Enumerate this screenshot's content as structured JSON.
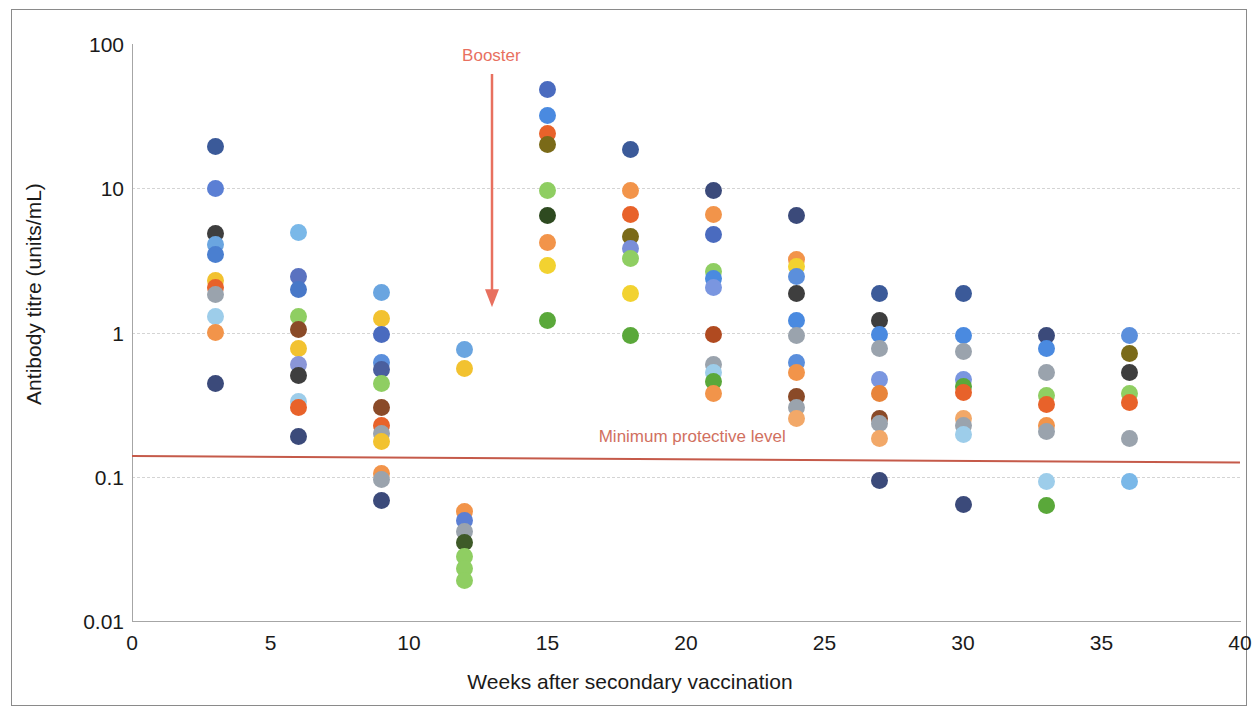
{
  "chart_data": {
    "type": "scatter",
    "title": "",
    "xlabel": "Weeks after secondary vaccination",
    "ylabel": "Antibody titre (units/mL)",
    "yscale": "log",
    "ylim": [
      0.01,
      100
    ],
    "xlim": [
      0,
      40
    ],
    "grid": true,
    "legend": "none",
    "ytick_labels": [
      "100",
      "10",
      "1",
      "0.1",
      "0.01"
    ],
    "ytick_values": [
      100,
      10,
      1,
      0.1,
      0.01
    ],
    "xtick_labels": [
      "0",
      "5",
      "10",
      "15",
      "20",
      "25",
      "30",
      "35",
      "40"
    ],
    "xtick_values": [
      0,
      5,
      10,
      15,
      20,
      25,
      30,
      35,
      40
    ],
    "annotations": [
      {
        "name": "booster",
        "text": "Booster",
        "x": 13.0,
        "color": "#e8705f",
        "arrow_from_y": 62,
        "arrow_to_y": 1.5
      },
      {
        "name": "minimum-protective-level",
        "text": "Minimum protective level",
        "x": 21.0,
        "y": 0.155,
        "color": "#d1705f"
      }
    ],
    "threshold": {
      "label": "Minimum protective level",
      "y_left": 0.142,
      "y_right": 0.128,
      "color": "#c55a4a"
    },
    "points": [
      {
        "x": 3,
        "y": 19.5,
        "color": "#3b5a99"
      },
      {
        "x": 3,
        "y": 9.9,
        "color": "#5b7fd4"
      },
      {
        "x": 3,
        "y": 4.85,
        "color": "#3e3e3e"
      },
      {
        "x": 3,
        "y": 4.05,
        "color": "#6aa5e0"
      },
      {
        "x": 3,
        "y": 3.45,
        "color": "#4a7fd0"
      },
      {
        "x": 3,
        "y": 2.3,
        "color": "#f2c230"
      },
      {
        "x": 3,
        "y": 2.05,
        "color": "#e8622a"
      },
      {
        "x": 3,
        "y": 1.82,
        "color": "#9aa3ad"
      },
      {
        "x": 3,
        "y": 1.3,
        "color": "#9dcdea"
      },
      {
        "x": 3,
        "y": 1.0,
        "color": "#f2944a"
      },
      {
        "x": 3,
        "y": 0.44,
        "color": "#3b4a7a"
      },
      {
        "x": 6,
        "y": 4.95,
        "color": "#7ab8e8"
      },
      {
        "x": 6,
        "y": 2.45,
        "color": "#5a72c0"
      },
      {
        "x": 6,
        "y": 2.0,
        "color": "#4878c8"
      },
      {
        "x": 6,
        "y": 1.3,
        "color": "#8fce62"
      },
      {
        "x": 6,
        "y": 1.05,
        "color": "#8a4a28"
      },
      {
        "x": 6,
        "y": 0.78,
        "color": "#f2c230"
      },
      {
        "x": 6,
        "y": 0.6,
        "color": "#8a96d8"
      },
      {
        "x": 6,
        "y": 0.5,
        "color": "#3e3e3e"
      },
      {
        "x": 6,
        "y": 0.33,
        "color": "#9dcdea"
      },
      {
        "x": 6,
        "y": 0.3,
        "color": "#e8622a"
      },
      {
        "x": 6,
        "y": 0.19,
        "color": "#3b4a7a"
      },
      {
        "x": 9,
        "y": 1.9,
        "color": "#6aa5e0"
      },
      {
        "x": 9,
        "y": 1.25,
        "color": "#f2c230"
      },
      {
        "x": 9,
        "y": 0.97,
        "color": "#4a6bbf"
      },
      {
        "x": 9,
        "y": 0.62,
        "color": "#5b8fdc"
      },
      {
        "x": 9,
        "y": 0.55,
        "color": "#4a5f9e"
      },
      {
        "x": 9,
        "y": 0.44,
        "color": "#8fce62"
      },
      {
        "x": 9,
        "y": 0.3,
        "color": "#8a4a28"
      },
      {
        "x": 9,
        "y": 0.225,
        "color": "#e8622a"
      },
      {
        "x": 9,
        "y": 0.2,
        "color": "#9aa3ad"
      },
      {
        "x": 9,
        "y": 0.175,
        "color": "#f2c230"
      },
      {
        "x": 9,
        "y": 0.105,
        "color": "#f2944a"
      },
      {
        "x": 9,
        "y": 0.095,
        "color": "#9aa3ad"
      },
      {
        "x": 9,
        "y": 0.068,
        "color": "#3b4a7a"
      },
      {
        "x": 12,
        "y": 0.76,
        "color": "#6aa5e0"
      },
      {
        "x": 12,
        "y": 0.56,
        "color": "#f2c230"
      },
      {
        "x": 12,
        "y": 0.057,
        "color": "#f2944a"
      },
      {
        "x": 12,
        "y": 0.05,
        "color": "#5b7fd4"
      },
      {
        "x": 12,
        "y": 0.042,
        "color": "#9aa3ad"
      },
      {
        "x": 12,
        "y": 0.035,
        "color": "#3e5a28"
      },
      {
        "x": 12,
        "y": 0.028,
        "color": "#8fce62"
      },
      {
        "x": 12,
        "y": 0.023,
        "color": "#8fce62"
      },
      {
        "x": 12,
        "y": 0.019,
        "color": "#8fce62"
      },
      {
        "x": 15,
        "y": 48.0,
        "color": "#4a6bbf"
      },
      {
        "x": 15,
        "y": 32.0,
        "color": "#4a8ae0"
      },
      {
        "x": 15,
        "y": 24.0,
        "color": "#e8622a"
      },
      {
        "x": 15,
        "y": 20.0,
        "color": "#7a6a18"
      },
      {
        "x": 15,
        "y": 9.7,
        "color": "#8fce62"
      },
      {
        "x": 15,
        "y": 6.5,
        "color": "#2e4a20"
      },
      {
        "x": 15,
        "y": 4.2,
        "color": "#f2944a"
      },
      {
        "x": 15,
        "y": 2.9,
        "color": "#f2d230"
      },
      {
        "x": 15,
        "y": 1.22,
        "color": "#5aa83a"
      },
      {
        "x": 18,
        "y": 18.5,
        "color": "#3b5a99"
      },
      {
        "x": 18,
        "y": 9.7,
        "color": "#f2944a"
      },
      {
        "x": 18,
        "y": 6.6,
        "color": "#e8622a"
      },
      {
        "x": 18,
        "y": 4.6,
        "color": "#7a6a18"
      },
      {
        "x": 18,
        "y": 3.8,
        "color": "#7a8ed8"
      },
      {
        "x": 18,
        "y": 3.25,
        "color": "#8fce62"
      },
      {
        "x": 18,
        "y": 1.87,
        "color": "#f2d230"
      },
      {
        "x": 18,
        "y": 0.96,
        "color": "#5aa83a"
      },
      {
        "x": 21,
        "y": 9.6,
        "color": "#3b4a7a"
      },
      {
        "x": 21,
        "y": 6.6,
        "color": "#f2944a"
      },
      {
        "x": 21,
        "y": 4.8,
        "color": "#4a6bbf"
      },
      {
        "x": 21,
        "y": 2.65,
        "color": "#8fce62"
      },
      {
        "x": 21,
        "y": 2.35,
        "color": "#4a8ae0"
      },
      {
        "x": 21,
        "y": 2.05,
        "color": "#7a96e0"
      },
      {
        "x": 21,
        "y": 0.97,
        "color": "#b04a20"
      },
      {
        "x": 21,
        "y": 0.6,
        "color": "#9aa3ad"
      },
      {
        "x": 21,
        "y": 0.53,
        "color": "#9dcdea"
      },
      {
        "x": 21,
        "y": 0.46,
        "color": "#5aa83a"
      },
      {
        "x": 21,
        "y": 0.38,
        "color": "#f2944a"
      },
      {
        "x": 24,
        "y": 6.5,
        "color": "#3b4a7a"
      },
      {
        "x": 24,
        "y": 3.2,
        "color": "#f2944a"
      },
      {
        "x": 24,
        "y": 2.85,
        "color": "#f2d230"
      },
      {
        "x": 24,
        "y": 2.45,
        "color": "#5b8fdc"
      },
      {
        "x": 24,
        "y": 1.87,
        "color": "#3e3e3e"
      },
      {
        "x": 24,
        "y": 1.22,
        "color": "#4a8ae0"
      },
      {
        "x": 24,
        "y": 0.95,
        "color": "#9aa3ad"
      },
      {
        "x": 24,
        "y": 0.62,
        "color": "#5b8fdc"
      },
      {
        "x": 24,
        "y": 0.53,
        "color": "#f2944a"
      },
      {
        "x": 24,
        "y": 0.36,
        "color": "#8a4a28"
      },
      {
        "x": 24,
        "y": 0.3,
        "color": "#9aa3ad"
      },
      {
        "x": 24,
        "y": 0.255,
        "color": "#f2a868"
      },
      {
        "x": 27,
        "y": 1.85,
        "color": "#3b5a99"
      },
      {
        "x": 27,
        "y": 1.22,
        "color": "#3e3e3e"
      },
      {
        "x": 27,
        "y": 0.97,
        "color": "#4a8ae0"
      },
      {
        "x": 27,
        "y": 0.78,
        "color": "#9aa3ad"
      },
      {
        "x": 27,
        "y": 0.47,
        "color": "#7a96e0"
      },
      {
        "x": 27,
        "y": 0.38,
        "color": "#e8843a"
      },
      {
        "x": 27,
        "y": 0.255,
        "color": "#8a4a28"
      },
      {
        "x": 27,
        "y": 0.235,
        "color": "#9aa3ad"
      },
      {
        "x": 27,
        "y": 0.185,
        "color": "#f2a868"
      },
      {
        "x": 27,
        "y": 0.094,
        "color": "#3b4a7a"
      },
      {
        "x": 30,
        "y": 1.85,
        "color": "#3b5a99"
      },
      {
        "x": 30,
        "y": 0.96,
        "color": "#4a8ae0"
      },
      {
        "x": 30,
        "y": 0.74,
        "color": "#9aa3ad"
      },
      {
        "x": 30,
        "y": 0.47,
        "color": "#7a96e0"
      },
      {
        "x": 30,
        "y": 0.42,
        "color": "#5aa83a"
      },
      {
        "x": 30,
        "y": 0.385,
        "color": "#e8622a"
      },
      {
        "x": 30,
        "y": 0.255,
        "color": "#f2a868"
      },
      {
        "x": 30,
        "y": 0.225,
        "color": "#9aa3ad"
      },
      {
        "x": 30,
        "y": 0.195,
        "color": "#9dcdea"
      },
      {
        "x": 30,
        "y": 0.064,
        "color": "#3b4a7a"
      },
      {
        "x": 33,
        "y": 0.95,
        "color": "#3b4a7a"
      },
      {
        "x": 33,
        "y": 0.78,
        "color": "#4a8ae0"
      },
      {
        "x": 33,
        "y": 0.53,
        "color": "#9aa3ad"
      },
      {
        "x": 33,
        "y": 0.365,
        "color": "#8fce62"
      },
      {
        "x": 33,
        "y": 0.315,
        "color": "#e8622a"
      },
      {
        "x": 33,
        "y": 0.225,
        "color": "#f2944a"
      },
      {
        "x": 33,
        "y": 0.205,
        "color": "#9aa3ad"
      },
      {
        "x": 33,
        "y": 0.093,
        "color": "#9dcdea"
      },
      {
        "x": 33,
        "y": 0.063,
        "color": "#5aa83a"
      },
      {
        "x": 36,
        "y": 0.95,
        "color": "#5b8fdc"
      },
      {
        "x": 36,
        "y": 0.72,
        "color": "#7a6a18"
      },
      {
        "x": 36,
        "y": 0.53,
        "color": "#3e3e3e"
      },
      {
        "x": 36,
        "y": 0.38,
        "color": "#8fce62"
      },
      {
        "x": 36,
        "y": 0.325,
        "color": "#e8622a"
      },
      {
        "x": 36,
        "y": 0.185,
        "color": "#9aa3ad"
      },
      {
        "x": 36,
        "y": 0.093,
        "color": "#7ab8e8"
      }
    ]
  }
}
